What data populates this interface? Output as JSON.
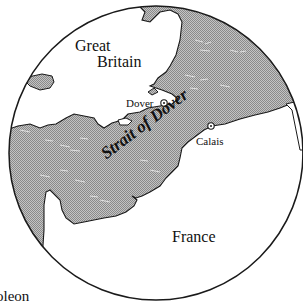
{
  "map": {
    "labels": {
      "great_britain_line1": "Great",
      "great_britain_line2": "Britain",
      "france": "France",
      "strait": "Strait of Dover",
      "dover": "Dover",
      "calais": "Calais"
    },
    "caption_fragment": "oleon",
    "colors": {
      "sea": "#a8a8a8",
      "land": "#ffffff",
      "outline": "#1a1a1a"
    },
    "markers": [
      {
        "name": "Dover",
        "symbol": "circled-dot"
      },
      {
        "name": "Calais",
        "symbol": "circled-dot"
      }
    ]
  }
}
